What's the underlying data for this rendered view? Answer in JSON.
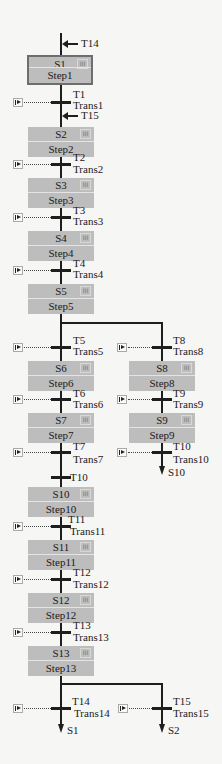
{
  "diagram": {
    "type": "SFC (sequential function chart)",
    "jumps_in": [
      {
        "id": "jin1",
        "label": "T14",
        "x": 61,
        "y": 44
      },
      {
        "id": "jin2",
        "label": "T15",
        "x": 61,
        "y": 116
      }
    ],
    "steps": [
      {
        "name": "S1",
        "label": "Step1",
        "x": 28,
        "y": 55,
        "initial": true
      },
      {
        "name": "S2",
        "label": "Step2",
        "x": 28,
        "y": 127
      },
      {
        "name": "S3",
        "label": "Step3",
        "x": 28,
        "y": 178
      },
      {
        "name": "S4",
        "label": "Step4",
        "x": 28,
        "y": 231
      },
      {
        "name": "S5",
        "label": "Step5",
        "x": 28,
        "y": 284
      },
      {
        "name": "S6",
        "label": "Step6",
        "x": 28,
        "y": 361
      },
      {
        "name": "S7",
        "label": "Step7",
        "x": 28,
        "y": 413
      },
      {
        "name": "S8",
        "label": "Step8",
        "x": 129,
        "y": 361
      },
      {
        "name": "S9",
        "label": "Step9",
        "x": 129,
        "y": 413
      },
      {
        "name": "S10",
        "label": "Step10",
        "x": 28,
        "y": 487
      },
      {
        "name": "S11",
        "label": "Step11",
        "x": 28,
        "y": 540
      },
      {
        "name": "S12",
        "label": "Step12",
        "x": 28,
        "y": 593
      },
      {
        "name": "S13",
        "label": "Step13",
        "x": 28,
        "y": 646
      }
    ],
    "transitions": [
      {
        "name": "T1",
        "label": "Trans1",
        "x": 61,
        "y": 102,
        "condition": true
      },
      {
        "name": "T2",
        "label": "Trans2",
        "x": 61,
        "y": 164,
        "condition": true
      },
      {
        "name": "T3",
        "label": "Trans3",
        "x": 61,
        "y": 217,
        "condition": true
      },
      {
        "name": "T4",
        "label": "Trans4",
        "x": 61,
        "y": 270,
        "condition": true
      },
      {
        "name": "T5",
        "label": "Trans5",
        "x": 61,
        "y": 347,
        "condition": true
      },
      {
        "name": "T6",
        "label": "Trans6",
        "x": 61,
        "y": 399,
        "condition": true
      },
      {
        "name": "T7",
        "label": "Trans7",
        "x": 61,
        "y": 452,
        "condition": true
      },
      {
        "name": "T10",
        "label": "",
        "x": 61,
        "y": 477,
        "condition": false
      },
      {
        "name": "T8",
        "label": "Trans8",
        "x": 162,
        "y": 347,
        "condition": true
      },
      {
        "name": "T9",
        "label": "Trans9",
        "x": 162,
        "y": 399,
        "condition": true
      },
      {
        "name": "T10",
        "label": "Trans10",
        "x": 162,
        "y": 452,
        "condition": true
      },
      {
        "name": "T11",
        "label": "Trans11",
        "x": 61,
        "y": 526,
        "condition": true
      },
      {
        "name": "T12",
        "label": "Trans12",
        "x": 61,
        "y": 579,
        "condition": true
      },
      {
        "name": "T13",
        "label": "Trans13",
        "x": 61,
        "y": 632,
        "condition": true
      },
      {
        "name": "T14",
        "label": "Trans14",
        "x": 61,
        "y": 708,
        "condition": true
      },
      {
        "name": "T15",
        "label": "Trans15",
        "x": 162,
        "y": 708,
        "condition": true
      }
    ],
    "jumps_out": [
      {
        "target": "S10",
        "x": 162,
        "y": 470
      },
      {
        "target": "S1",
        "x": 61,
        "y": 724
      },
      {
        "target": "S2",
        "x": 162,
        "y": 724
      }
    ],
    "action_icon": "III"
  }
}
